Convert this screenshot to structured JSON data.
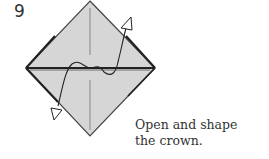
{
  "step": {
    "number": "9",
    "caption_line1": "Open and shape",
    "caption_line2": "the crown."
  },
  "colors": {
    "paper_fill": "#d6d6d6",
    "outline": "#333333",
    "crease": "#888888"
  }
}
